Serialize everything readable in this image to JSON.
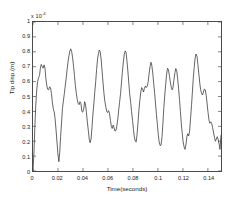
{
  "figure": {
    "background_color": "#ffffff",
    "axis_color": "#4a4a4a",
    "line_color": "#3b3b3b"
  },
  "axes": {
    "y_exponent_prefix": "x 10",
    "y_exponent_power": "-4",
    "x_title": "Time(seconds)",
    "y_title": "Tip disp.(m)",
    "x_tick_labels": [
      "0",
      "0.02",
      "0.04",
      "0.06",
      "0.08",
      "0.1",
      "0.12",
      "0.14"
    ],
    "y_tick_labels": [
      "0",
      "0.1",
      "0.2",
      "0.3",
      "0.4",
      "0.5",
      "0.6",
      "0.7",
      "0.8",
      "0.9",
      "1"
    ]
  },
  "chart_data": {
    "type": "line",
    "title": "",
    "xlabel": "Time(seconds)",
    "ylabel": "Tip disp.(m)",
    "y_scale_factor": "1e-4",
    "xlim": [
      0,
      0.1505
    ],
    "ylim": [
      0,
      1
    ],
    "x_ticks": [
      0,
      0.02,
      0.04,
      0.06,
      0.08,
      0.1,
      0.12,
      0.14
    ],
    "y_ticks": [
      0,
      0.1,
      0.2,
      0.3,
      0.4,
      0.5,
      0.6,
      0.7,
      0.8,
      0.9,
      1
    ],
    "grid": false,
    "legend": null,
    "series": [
      {
        "name": "Tip displacement",
        "color": "#3b3b3b",
        "line_width": 0.8,
        "x": [
          0.0,
          0.0008,
          0.0015,
          0.0022,
          0.003,
          0.0037,
          0.0044,
          0.0052,
          0.0059,
          0.0066,
          0.0074,
          0.0081,
          0.0089,
          0.0096,
          0.0103,
          0.0111,
          0.0118,
          0.0125,
          0.0133,
          0.014,
          0.0148,
          0.0155,
          0.0162,
          0.017,
          0.0177,
          0.0184,
          0.0192,
          0.0199,
          0.0207,
          0.0214,
          0.0221,
          0.0229,
          0.0236,
          0.0243,
          0.0251,
          0.0258,
          0.0266,
          0.0273,
          0.028,
          0.0288,
          0.0295,
          0.0302,
          0.031,
          0.0317,
          0.0325,
          0.0332,
          0.0339,
          0.0347,
          0.0354,
          0.0361,
          0.0369,
          0.0376,
          0.0384,
          0.0391,
          0.0398,
          0.0406,
          0.0413,
          0.042,
          0.0428,
          0.0435,
          0.0443,
          0.045,
          0.0457,
          0.0465,
          0.0472,
          0.0479,
          0.0487,
          0.0494,
          0.0502,
          0.0509,
          0.0516,
          0.0524,
          0.0531,
          0.0538,
          0.0546,
          0.0553,
          0.0561,
          0.0568,
          0.0575,
          0.0583,
          0.059,
          0.0597,
          0.0605,
          0.0612,
          0.062,
          0.0627,
          0.0634,
          0.0642,
          0.0649,
          0.0656,
          0.0664,
          0.0671,
          0.0679,
          0.0686,
          0.0693,
          0.0701,
          0.0708,
          0.0715,
          0.0723,
          0.073,
          0.0738,
          0.0745,
          0.0752,
          0.076,
          0.0767,
          0.0774,
          0.0782,
          0.0789,
          0.0797,
          0.0804,
          0.0811,
          0.0819,
          0.0826,
          0.0833,
          0.0841,
          0.0848,
          0.0856,
          0.0863,
          0.087,
          0.0878,
          0.0885,
          0.0892,
          0.09,
          0.0907,
          0.0915,
          0.0922,
          0.0929,
          0.0937,
          0.0944,
          0.0951,
          0.0959,
          0.0966,
          0.0974,
          0.0981,
          0.0988,
          0.0996,
          0.1003,
          0.101,
          0.1018,
          0.1025,
          0.1033,
          0.104,
          0.1047,
          0.1055,
          0.1062,
          0.1069,
          0.1077,
          0.1084,
          0.1092,
          0.1099,
          0.1106,
          0.1114,
          0.1121,
          0.1128,
          0.1136,
          0.1143,
          0.1151,
          0.1158,
          0.1165,
          0.1173,
          0.118,
          0.1187,
          0.1195,
          0.1202,
          0.121,
          0.1217,
          0.1224,
          0.1232,
          0.1239,
          0.1246,
          0.1254,
          0.1261,
          0.1269,
          0.1276,
          0.1283,
          0.1291,
          0.1298,
          0.1305,
          0.1313,
          0.132,
          0.1328,
          0.1335,
          0.1342,
          0.135,
          0.1357,
          0.1364,
          0.1372,
          0.1379,
          0.1387,
          0.1394,
          0.1401,
          0.1409,
          0.1416,
          0.1423,
          0.1431,
          0.1438,
          0.1446,
          0.1453,
          0.146,
          0.1468,
          0.1475,
          0.1482,
          0.149,
          0.1497,
          0.1505
        ],
        "y": [
          0.0,
          0.13,
          0.3,
          0.44,
          0.545,
          0.6,
          0.625,
          0.64,
          0.69,
          0.715,
          0.7,
          0.69,
          0.712,
          0.69,
          0.62,
          0.57,
          0.548,
          0.545,
          0.565,
          0.56,
          0.52,
          0.46,
          0.42,
          0.395,
          0.35,
          0.28,
          0.195,
          0.12,
          0.062,
          0.125,
          0.23,
          0.33,
          0.42,
          0.47,
          0.52,
          0.57,
          0.625,
          0.68,
          0.73,
          0.775,
          0.805,
          0.82,
          0.8,
          0.76,
          0.7,
          0.64,
          0.575,
          0.52,
          0.48,
          0.455,
          0.445,
          0.465,
          0.452,
          0.4,
          0.395,
          0.415,
          0.465,
          0.45,
          0.39,
          0.33,
          0.272,
          0.215,
          0.19,
          0.215,
          0.29,
          0.375,
          0.45,
          0.525,
          0.6,
          0.68,
          0.745,
          0.79,
          0.812,
          0.8,
          0.745,
          0.67,
          0.59,
          0.52,
          0.47,
          0.43,
          0.4,
          0.392,
          0.405,
          0.388,
          0.34,
          0.3,
          0.285,
          0.308,
          0.29,
          0.268,
          0.272,
          0.3,
          0.35,
          0.41,
          0.46,
          0.52,
          0.59,
          0.66,
          0.73,
          0.78,
          0.806,
          0.795,
          0.74,
          0.665,
          0.59,
          0.52,
          0.46,
          0.4,
          0.34,
          0.28,
          0.23,
          0.2,
          0.195,
          0.245,
          0.33,
          0.41,
          0.48,
          0.53,
          0.56,
          0.548,
          0.53,
          0.555,
          0.57,
          0.56,
          0.57,
          0.6,
          0.65,
          0.7,
          0.73,
          0.71,
          0.655,
          0.59,
          0.52,
          0.45,
          0.38,
          0.31,
          0.245,
          0.195,
          0.17,
          0.175,
          0.23,
          0.32,
          0.42,
          0.51,
          0.58,
          0.645,
          0.69,
          0.68,
          0.64,
          0.6,
          0.565,
          0.545,
          0.56,
          0.61,
          0.66,
          0.688,
          0.67,
          0.62,
          0.555,
          0.48,
          0.4,
          0.32,
          0.25,
          0.195,
          0.16,
          0.145,
          0.175,
          0.23,
          0.25,
          0.235,
          0.27,
          0.35,
          0.44,
          0.53,
          0.62,
          0.7,
          0.76,
          0.785,
          0.77,
          0.715,
          0.65,
          0.59,
          0.545,
          0.52,
          0.51,
          0.53,
          0.55,
          0.545,
          0.505,
          0.45,
          0.395,
          0.34,
          0.32,
          0.33,
          0.318,
          0.29,
          0.255,
          0.225,
          0.2,
          0.215,
          0.23,
          0.212,
          0.18,
          0.145,
          0.24
        ]
      }
    ]
  }
}
